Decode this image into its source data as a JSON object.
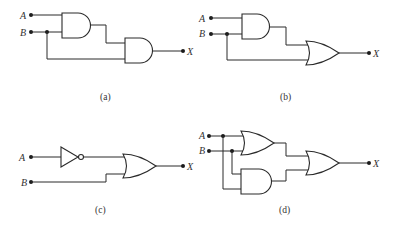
{
  "figure": {
    "circuits": [
      {
        "id": "a",
        "caption": "(a)",
        "inputs": [
          "A",
          "B"
        ],
        "output": "X",
        "gates": [
          "AND",
          "AND"
        ]
      },
      {
        "id": "b",
        "caption": "(b)",
        "inputs": [
          "A",
          "B"
        ],
        "output": "X",
        "gates": [
          "AND",
          "OR"
        ]
      },
      {
        "id": "c",
        "caption": "(c)",
        "inputs": [
          "A",
          "B"
        ],
        "output": "X",
        "gates": [
          "NOT",
          "OR"
        ]
      },
      {
        "id": "d",
        "caption": "(d)",
        "inputs": [
          "A",
          "B"
        ],
        "output": "X",
        "gates": [
          "OR",
          "AND",
          "OR"
        ]
      }
    ]
  }
}
